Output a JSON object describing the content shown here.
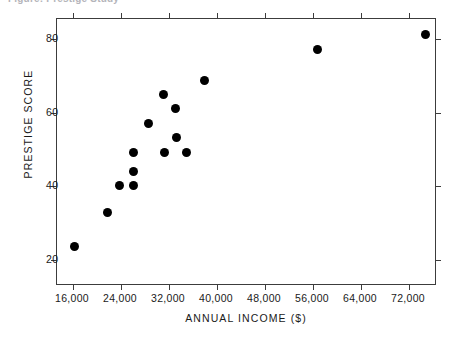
{
  "caption": {
    "text": "Figure: Prestige Study"
  },
  "chart_data": {
    "type": "scatter",
    "title": "",
    "xlabel": "ANNUAL INCOME ($)",
    "ylabel": "PRESTIGE SCORE",
    "xlim": [
      13333,
      76667
    ],
    "ylim": [
      12.9,
      85.5
    ],
    "grid": false,
    "legend": false,
    "marker": {
      "shape": "circle",
      "color": "#000000",
      "size": 9
    },
    "xticks": [
      16000,
      24000,
      32000,
      40000,
      48000,
      56000,
      64000,
      72000
    ],
    "xtick_labels": [
      "16,000",
      "24,000",
      "32,000",
      "40,000",
      "48,000",
      "56,000",
      "64,000",
      "72,000"
    ],
    "yticks": [
      20,
      40,
      60,
      80
    ],
    "ytick_labels": [
      "20",
      "40",
      "60",
      "80"
    ],
    "points": [
      {
        "x": 16300,
        "y": 23.7
      },
      {
        "x": 21800,
        "y": 32.9
      },
      {
        "x": 23800,
        "y": 40.3
      },
      {
        "x": 26100,
        "y": 40.3
      },
      {
        "x": 26100,
        "y": 43.9
      },
      {
        "x": 26100,
        "y": 49.2
      },
      {
        "x": 28500,
        "y": 57.1
      },
      {
        "x": 31000,
        "y": 65.0
      },
      {
        "x": 31200,
        "y": 49.2
      },
      {
        "x": 33100,
        "y": 61.3
      },
      {
        "x": 33200,
        "y": 53.4
      },
      {
        "x": 34900,
        "y": 49.2
      },
      {
        "x": 37900,
        "y": 68.9
      },
      {
        "x": 56800,
        "y": 77.1
      },
      {
        "x": 74800,
        "y": 81.3
      }
    ]
  }
}
